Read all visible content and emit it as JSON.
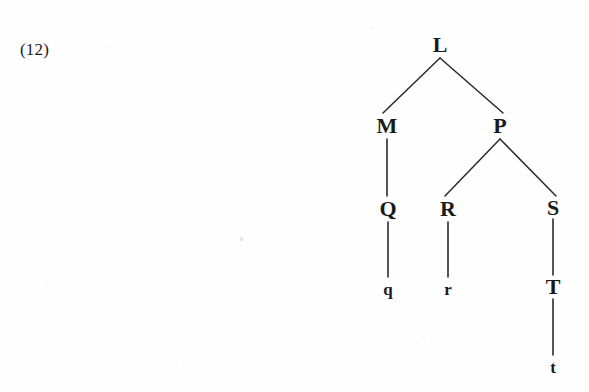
{
  "example": {
    "number_label": "(12)",
    "x": 20,
    "y": 50
  },
  "colors": {
    "ink": "#1a1a1a",
    "line": "#2b2b2b",
    "paper": "#fefefe"
  },
  "diagram": {
    "type": "syntax-tree",
    "nodes": [
      {
        "id": "L",
        "label": "L",
        "kind": "nonterminal",
        "x": 440,
        "y": 45
      },
      {
        "id": "M",
        "label": "M",
        "kind": "nonterminal",
        "x": 387,
        "y": 126
      },
      {
        "id": "P",
        "label": "P",
        "kind": "nonterminal",
        "x": 500,
        "y": 126
      },
      {
        "id": "Q",
        "label": "Q",
        "kind": "nonterminal",
        "x": 388,
        "y": 209
      },
      {
        "id": "R",
        "label": "R",
        "kind": "nonterminal",
        "x": 448,
        "y": 209
      },
      {
        "id": "S",
        "label": "S",
        "kind": "nonterminal",
        "x": 553,
        "y": 208
      },
      {
        "id": "T",
        "label": "T",
        "kind": "nonterminal",
        "x": 553,
        "y": 287
      },
      {
        "id": "q",
        "label": "q",
        "kind": "terminal",
        "x": 388,
        "y": 289
      },
      {
        "id": "r",
        "label": "r",
        "kind": "terminal",
        "x": 448,
        "y": 289
      },
      {
        "id": "t",
        "label": "t",
        "kind": "terminal",
        "x": 553,
        "y": 367
      }
    ],
    "edges": [
      {
        "from": "L",
        "to": "M",
        "x1": 440,
        "y1": 58,
        "x2": 383,
        "y2": 113,
        "style": "diagonal"
      },
      {
        "from": "L",
        "to": "P",
        "x1": 440,
        "y1": 58,
        "x2": 503,
        "y2": 113,
        "style": "diagonal"
      },
      {
        "from": "M",
        "to": "Q",
        "x1": 387,
        "y1": 139,
        "x2": 387,
        "y2": 196,
        "style": "vertical"
      },
      {
        "from": "P",
        "to": "R",
        "x1": 500,
        "y1": 139,
        "x2": 445,
        "y2": 196,
        "style": "diagonal"
      },
      {
        "from": "P",
        "to": "S",
        "x1": 500,
        "y1": 139,
        "x2": 556,
        "y2": 196,
        "style": "diagonal"
      },
      {
        "from": "Q",
        "to": "q",
        "x1": 388,
        "y1": 222,
        "x2": 388,
        "y2": 277,
        "style": "vertical"
      },
      {
        "from": "R",
        "to": "r",
        "x1": 448,
        "y1": 222,
        "x2": 448,
        "y2": 277,
        "style": "vertical"
      },
      {
        "from": "S",
        "to": "T",
        "x1": 553,
        "y1": 219,
        "x2": 553,
        "y2": 275,
        "style": "vertical"
      },
      {
        "from": "T",
        "to": "t",
        "x1": 553,
        "y1": 299,
        "x2": 553,
        "y2": 355,
        "style": "vertical"
      }
    ]
  }
}
